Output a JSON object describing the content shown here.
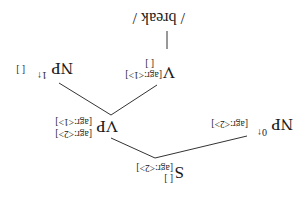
{
  "orientation": "rotated-180",
  "tree": {
    "root": {
      "label": "S",
      "features": [
        "[agr:<2>]",
        "[ ]"
      ]
    },
    "subject": {
      "label": "NP",
      "superscript": "0↑",
      "features": [
        "[agr:<2>]"
      ]
    },
    "vp": {
      "label": "VP",
      "features": [
        "[agr:<2>]",
        "[agr:<1>]"
      ]
    },
    "verb": {
      "label": "V",
      "features": [
        "[agr:<1>]",
        "[ ]"
      ]
    },
    "object": {
      "label": "NP",
      "superscript": "1↑",
      "features": [
        "[ ]"
      ]
    },
    "leaf": {
      "text": "/ break /"
    }
  },
  "colors": {
    "ink": "#1a1a1a",
    "background": "#ffffff"
  }
}
